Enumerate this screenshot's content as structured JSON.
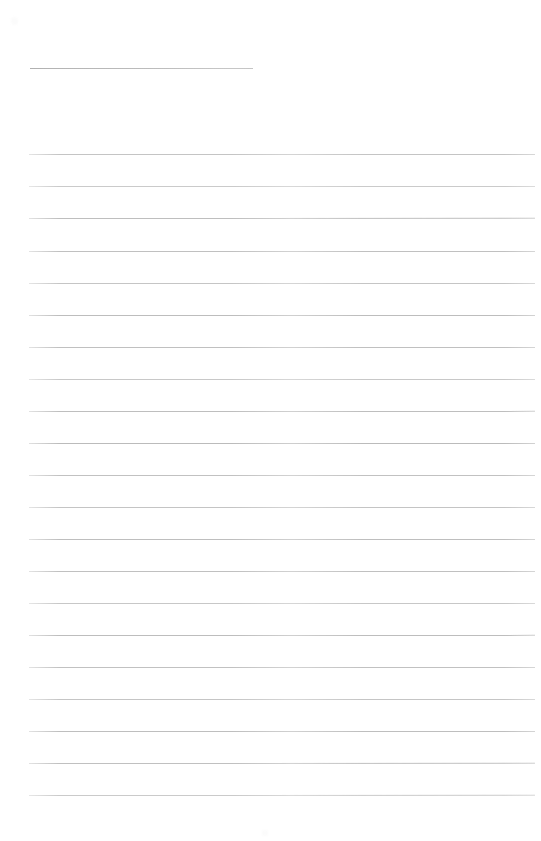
{
  "document": {
    "type": "ruled-paper",
    "kind": "blank lined notebook page",
    "page_width": 541,
    "page_height": 841,
    "background_color": "#ffffff",
    "rule_color": "#b6b6b6",
    "header_rule_color": "#b9b9b9",
    "text_content": "",
    "header_text": "",
    "page_number": ""
  },
  "header_rule": {
    "name": "title-rule",
    "x": 30,
    "y": 68,
    "width": 223,
    "label": ""
  },
  "rules": {
    "count": 21,
    "left": 29,
    "right": 535,
    "width": 506,
    "first_y": 154,
    "spacing": 31.95,
    "lines": [
      {
        "index": 1,
        "y": 154,
        "opacity": 0.8,
        "slant": -0.2
      },
      {
        "index": 2,
        "y": 186,
        "opacity": 0.72,
        "slant": -0.15
      },
      {
        "index": 3,
        "y": 218,
        "opacity": 0.88,
        "slant": -0.25
      },
      {
        "index": 4,
        "y": 251,
        "opacity": 0.85,
        "slant": -0.2
      },
      {
        "index": 5,
        "y": 283,
        "opacity": 0.78,
        "slant": -0.18
      },
      {
        "index": 6,
        "y": 315,
        "opacity": 0.9,
        "slant": -0.22
      },
      {
        "index": 7,
        "y": 347,
        "opacity": 0.86,
        "slant": -0.2
      },
      {
        "index": 8,
        "y": 379,
        "opacity": 0.74,
        "slant": -0.16
      },
      {
        "index": 9,
        "y": 411,
        "opacity": 0.88,
        "slant": -0.24
      },
      {
        "index": 10,
        "y": 443,
        "opacity": 0.92,
        "slant": -0.22
      },
      {
        "index": 11,
        "y": 475,
        "opacity": 0.84,
        "slant": -0.2
      },
      {
        "index": 12,
        "y": 507,
        "opacity": 0.8,
        "slant": -0.18
      },
      {
        "index": 13,
        "y": 539,
        "opacity": 0.88,
        "slant": -0.22
      },
      {
        "index": 14,
        "y": 571,
        "opacity": 0.86,
        "slant": -0.2
      },
      {
        "index": 15,
        "y": 603,
        "opacity": 0.76,
        "slant": -0.16
      },
      {
        "index": 16,
        "y": 635,
        "opacity": 0.9,
        "slant": -0.24
      },
      {
        "index": 17,
        "y": 667,
        "opacity": 0.84,
        "slant": -0.2
      },
      {
        "index": 18,
        "y": 699,
        "opacity": 0.78,
        "slant": -0.18
      },
      {
        "index": 19,
        "y": 731,
        "opacity": 0.88,
        "slant": -0.22
      },
      {
        "index": 20,
        "y": 763,
        "opacity": 0.86,
        "slant": -0.26
      },
      {
        "index": 21,
        "y": 795,
        "opacity": 0.72,
        "slant": -0.28
      }
    ]
  },
  "artifacts": [
    {
      "name": "scan-smudge-top-left",
      "x": 11,
      "y": 17,
      "w": 7,
      "h": 8
    },
    {
      "name": "scan-smudge-bottom-center",
      "x": 262,
      "y": 830,
      "w": 6,
      "h": 6
    }
  ]
}
